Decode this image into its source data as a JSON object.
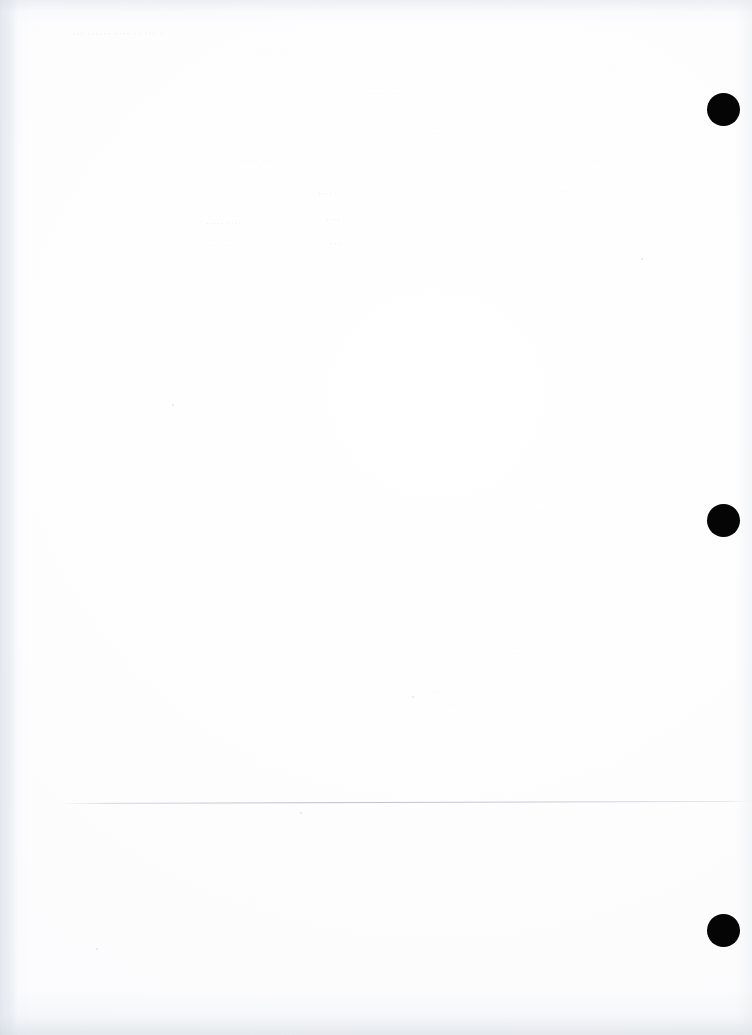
{
  "document": {
    "kind": "scanned-page",
    "page_width": 752,
    "page_height": 1035,
    "paper_color": "#fefeff",
    "ink_color": "#050505",
    "visible_text": "",
    "note": "Blank scanned page: no legible printed text, only faint bleed-through ghosting"
  },
  "marks": {
    "punch_marks": [
      {
        "label": "registration-mark-top",
        "cx": 723,
        "cy": 109,
        "d": 33,
        "color": "#050505"
      },
      {
        "label": "registration-mark-middle",
        "cx": 723,
        "cy": 520,
        "d": 33,
        "color": "#050505"
      },
      {
        "label": "registration-mark-bottom",
        "cx": 723,
        "cy": 930,
        "d": 33,
        "color": "#050505"
      }
    ],
    "rules": [
      {
        "label": "footer-hairline",
        "x": 62,
        "y": 803,
        "width": 690,
        "rotate_deg": -0.18,
        "color": "#b0b6c1"
      }
    ],
    "specks": [
      {
        "x": 172,
        "y": 404,
        "size": 2
      },
      {
        "x": 412,
        "y": 696,
        "size": 2
      },
      {
        "x": 96,
        "y": 948,
        "size": 2
      },
      {
        "x": 300,
        "y": 812,
        "size": 2
      },
      {
        "x": 641,
        "y": 258,
        "size": 2
      }
    ]
  },
  "ghost_text": {
    "description": "Illegible show-through from the reverse side of the sheet",
    "lines": [
      {
        "x": 72,
        "y": 27,
        "size": 11,
        "text": "··· ······ ····  ··  ··· ·",
        "weight": "strong",
        "skew": -0.6
      },
      {
        "x": 352,
        "y": 55,
        "size": 10,
        "text": "···· ··  ·····  ·· ···",
        "weight": "faint",
        "skew": -0.4
      },
      {
        "x": 258,
        "y": 44,
        "size": 10,
        "text": "·····  ··· ··",
        "weight": "faint",
        "skew": 0
      },
      {
        "x": 530,
        "y": 60,
        "size": 10,
        "text": "·· ···· ··· ·",
        "weight": "faint",
        "skew": 0
      },
      {
        "x": 596,
        "y": 63,
        "size": 10,
        "text": "··· ··",
        "weight": "faint",
        "skew": 0
      },
      {
        "x": 369,
        "y": 88,
        "size": 10,
        "text": "····  ·····",
        "weight": "faint",
        "skew": 0
      },
      {
        "x": 508,
        "y": 94,
        "size": 10,
        "text": "···  ···· ··",
        "weight": "faint",
        "skew": 0
      },
      {
        "x": 598,
        "y": 92,
        "size": 10,
        "text": "····",
        "weight": "faint",
        "skew": 0
      },
      {
        "x": 258,
        "y": 122,
        "size": 10,
        "text": "·····  ···",
        "weight": "faint",
        "skew": 0
      },
      {
        "x": 420,
        "y": 128,
        "size": 10,
        "text": "·····  ·· ···",
        "weight": "faint",
        "skew": 0
      },
      {
        "x": 540,
        "y": 124,
        "size": 10,
        "text": "··· ····",
        "weight": "faint",
        "skew": 0
      },
      {
        "x": 240,
        "y": 155,
        "size": 10,
        "text": "·····  ····",
        "weight": "faint",
        "skew": 0
      },
      {
        "x": 430,
        "y": 160,
        "size": 10,
        "text": "····  ···· ···",
        "weight": "faint",
        "skew": 0
      },
      {
        "x": 594,
        "y": 156,
        "size": 10,
        "text": "··· ···",
        "weight": "faint",
        "skew": 0
      },
      {
        "x": 318,
        "y": 188,
        "size": 10,
        "text": "····",
        "weight": "strong",
        "skew": 0
      },
      {
        "x": 430,
        "y": 184,
        "size": 10,
        "text": "·····  ···",
        "weight": "faint",
        "skew": 0
      },
      {
        "x": 548,
        "y": 186,
        "size": 10,
        "text": "··  ···· ··",
        "weight": "faint",
        "skew": 0
      },
      {
        "x": 206,
        "y": 218,
        "size": 10,
        "text": "····· ····",
        "weight": "strong",
        "skew": 0
      },
      {
        "x": 326,
        "y": 214,
        "size": 10,
        "text": "····",
        "weight": "strong",
        "skew": 0
      },
      {
        "x": 432,
        "y": 216,
        "size": 10,
        "text": "·· ····",
        "weight": "faint",
        "skew": 0
      },
      {
        "x": 548,
        "y": 210,
        "size": 10,
        "text": "··· ···",
        "weight": "faint",
        "skew": 0
      },
      {
        "x": 208,
        "y": 240,
        "size": 10,
        "text": "··· ····",
        "weight": "faint",
        "skew": 0
      },
      {
        "x": 330,
        "y": 238,
        "size": 10,
        "text": "···",
        "weight": "strong",
        "skew": 0
      },
      {
        "x": 438,
        "y": 240,
        "size": 10,
        "text": "··· ··",
        "weight": "faint",
        "skew": 0
      },
      {
        "x": 560,
        "y": 236,
        "size": 10,
        "text": "···· ·",
        "weight": "faint",
        "skew": 0
      },
      {
        "x": 244,
        "y": 264,
        "size": 10,
        "text": "····",
        "weight": "faint",
        "skew": 0
      },
      {
        "x": 428,
        "y": 262,
        "size": 10,
        "text": "····",
        "weight": "faint",
        "skew": 0
      },
      {
        "x": 596,
        "y": 260,
        "size": 10,
        "text": "·· ···",
        "weight": "faint",
        "skew": 0
      },
      {
        "x": 418,
        "y": 498,
        "size": 10,
        "text": "···· ··",
        "weight": "faint",
        "skew": 0
      },
      {
        "x": 536,
        "y": 506,
        "size": 10,
        "text": "···",
        "weight": "faint",
        "skew": 0
      },
      {
        "x": 462,
        "y": 556,
        "size": 10,
        "text": "·· ··",
        "weight": "faint",
        "skew": 0
      },
      {
        "x": 500,
        "y": 612,
        "size": 10,
        "text": "···",
        "weight": "faint",
        "skew": 0
      },
      {
        "x": 512,
        "y": 648,
        "size": 10,
        "text": "···",
        "weight": "faint",
        "skew": 0
      },
      {
        "x": 508,
        "y": 676,
        "size": 10,
        "text": "···· ··",
        "weight": "faint",
        "skew": 0
      },
      {
        "x": 432,
        "y": 686,
        "size": 10,
        "text": "··",
        "weight": "faint",
        "skew": 0
      },
      {
        "x": 446,
        "y": 700,
        "size": 10,
        "text": "···",
        "weight": "faint",
        "skew": 0
      },
      {
        "x": 150,
        "y": 402,
        "size": 10,
        "text": "·",
        "weight": "faint",
        "skew": 0
      },
      {
        "x": 200,
        "y": 740,
        "size": 10,
        "text": "··",
        "weight": "faint",
        "skew": 0
      }
    ]
  }
}
